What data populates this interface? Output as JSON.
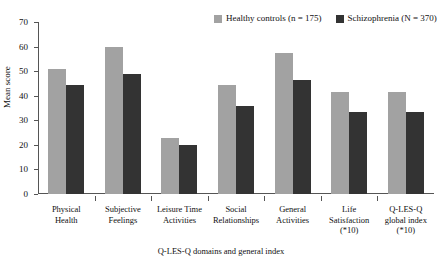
{
  "chart_data": {
    "type": "bar",
    "title": "",
    "xlabel": "Q-LES-Q domains and general index",
    "ylabel": "Mean score",
    "ylim": [
      0,
      70
    ],
    "yticks": [
      0,
      10,
      20,
      30,
      40,
      50,
      60,
      70
    ],
    "grid": false,
    "legend_position": "top-right",
    "categories": [
      "Physical Health",
      "Subjective Feelings",
      "Leisure Time Activities",
      "Social Relationships",
      "General Activities",
      "Life Satisfaction (*10)",
      "Q-LES-Q global index (*10)"
    ],
    "category_lines": [
      [
        "Physical",
        "Health"
      ],
      [
        "Subjective",
        "Feelings"
      ],
      [
        "Leisure Time",
        "Activities"
      ],
      [
        "Social",
        "Relationships"
      ],
      [
        "General",
        "Activities"
      ],
      [
        "Life",
        "Satisfaction",
        "(*10)"
      ],
      [
        "Q-LES-Q",
        "global index",
        "(*10)"
      ]
    ],
    "series": [
      {
        "name": "Healthy controls (n = 175)",
        "color": "#a2a2a2",
        "values": [
          51,
          60,
          23,
          44.5,
          57.5,
          41.5,
          41.5
        ]
      },
      {
        "name": "Schizophrenia (N = 370)",
        "color": "#333333",
        "values": [
          44.5,
          49,
          19.8,
          36,
          46.5,
          33.2,
          33.5
        ]
      }
    ]
  }
}
